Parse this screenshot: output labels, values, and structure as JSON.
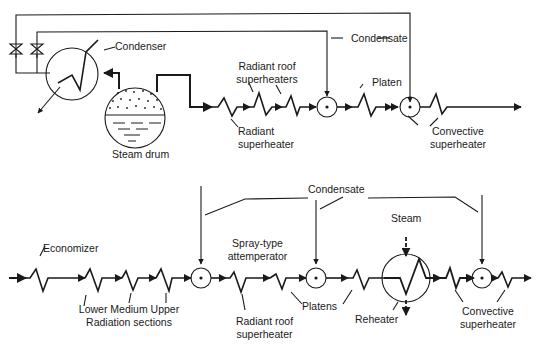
{
  "top_diagram": {
    "labels": {
      "condenser": "Condenser",
      "condensate": "Condensate",
      "steam_drum": "Steam drum",
      "radiant_roof_line1": "Radiant roof",
      "radiant_roof_line2": "superheaters",
      "radiant_sh_line1": "Radiant",
      "radiant_sh_line2": "superheater",
      "platen": "Platen",
      "convective_line1": "Convective",
      "convective_line2": "superheater"
    }
  },
  "bottom_diagram": {
    "labels": {
      "condensate": "Condensate",
      "economizer": "Economizer",
      "radiation_line1": "Lower Medium Upper",
      "radiation_line2": "Radiation sections",
      "spray_line1": "Spray-type",
      "spray_line2": "attemperator",
      "radiant_roof_line1": "Radiant roof",
      "radiant_roof_line2": "superheater",
      "platens": "Platens",
      "steam": "Steam",
      "reheater": "Reheater",
      "convective_line1": "Convective",
      "convective_line2": "superheater"
    }
  },
  "colors": {
    "line": "#1a1a1a",
    "background": "#ffffff"
  }
}
